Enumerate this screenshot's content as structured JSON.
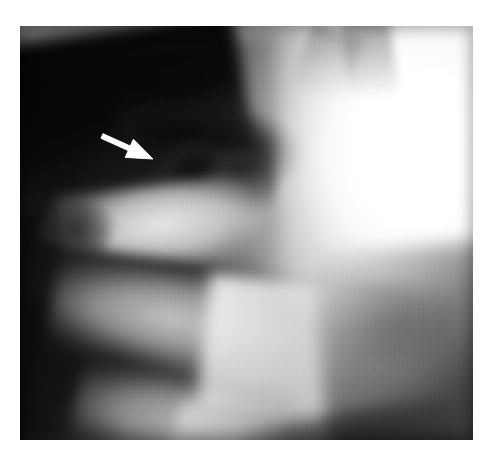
{
  "figure": {
    "kind": "radiograph",
    "modality_label": "X-ray",
    "view_label": "lateral",
    "region_label": "craniocervical junction / cervical spine",
    "plate": {
      "left": 20,
      "top": 26,
      "width": 453,
      "height": 414,
      "background_hex": "#141414",
      "border_hex": "#0f0f0f"
    },
    "tones": {
      "darkest_hex": "#0e0e0e",
      "dark_hex": "#242424",
      "mid_hex": "#8a8a8a",
      "light_hex": "#d8d8d8",
      "brightest_hex": "#fdfdfd",
      "page_hex": "#ffffff"
    }
  },
  "annotations": {
    "arrow": {
      "label": "white arrow marker",
      "color_hex": "#ffffff",
      "outline_hex": "#f2f2f2",
      "direction": "down-right",
      "tail_x": 82,
      "tail_y": 110,
      "tip_x": 133,
      "tip_y": 133,
      "shaft_width": 5,
      "head_length": 26,
      "head_width": 20,
      "points_at": "dark occipital condyle region"
    }
  },
  "caption": {
    "ghost_text": ""
  }
}
